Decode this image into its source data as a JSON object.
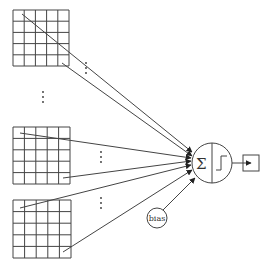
{
  "diagram": {
    "type": "perceptron",
    "input_grids": [
      {
        "id": "grid-1",
        "rows": 5,
        "cols": 5,
        "x": 13,
        "y": 10,
        "size": 56
      },
      {
        "id": "grid-2",
        "rows": 5,
        "cols": 5,
        "x": 13,
        "y": 127,
        "size": 57
      },
      {
        "id": "grid-3",
        "rows": 5,
        "cols": 5,
        "x": 13,
        "y": 200,
        "size": 58
      }
    ],
    "ellipsis_symbol": "⋮",
    "neuron": {
      "sum_symbol": "Σ",
      "activation": "step-function",
      "cx": 212,
      "cy": 163,
      "r": 20
    },
    "bias": {
      "label": "bias",
      "cx": 157,
      "cy": 218,
      "r": 10
    },
    "output": {
      "x": 243,
      "y": 155,
      "w": 16,
      "h": 16
    },
    "colors": {
      "stroke": "#444444",
      "background": "#ffffff"
    }
  }
}
